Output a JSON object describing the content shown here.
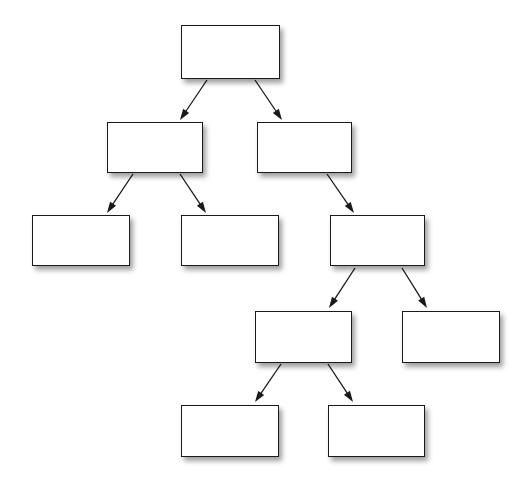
{
  "diagram": {
    "type": "tree-diagram",
    "title": "",
    "background_color": "#ffffff",
    "node_fill_color": "#ffffff",
    "node_border_color": "#1a1a1a",
    "edge_color": "#1a1a1a",
    "shadow_color": "rgba(0,0,0,0.38)",
    "node_count": 10,
    "edge_count": 9,
    "nodes": [
      {
        "id": "n1",
        "label": "",
        "level": 1,
        "x": 181,
        "y": 25,
        "w": 99,
        "h": 54
      },
      {
        "id": "n2",
        "label": "",
        "level": 2,
        "x": 107,
        "y": 122,
        "w": 96,
        "h": 51
      },
      {
        "id": "n3",
        "label": "",
        "level": 2,
        "x": 257,
        "y": 122,
        "w": 95,
        "h": 51
      },
      {
        "id": "n4",
        "label": "",
        "level": 3,
        "x": 32,
        "y": 215,
        "w": 98,
        "h": 51
      },
      {
        "id": "n5",
        "label": "",
        "level": 3,
        "x": 181,
        "y": 215,
        "w": 98,
        "h": 51
      },
      {
        "id": "n6",
        "label": "",
        "level": 3,
        "x": 330,
        "y": 215,
        "w": 95,
        "h": 51
      },
      {
        "id": "n7",
        "label": "",
        "level": 4,
        "x": 255,
        "y": 311,
        "w": 97,
        "h": 52
      },
      {
        "id": "n8",
        "label": "",
        "level": 4,
        "x": 402,
        "y": 311,
        "w": 98,
        "h": 52
      },
      {
        "id": "n9",
        "label": "",
        "level": 5,
        "x": 181,
        "y": 405,
        "w": 98,
        "h": 52
      },
      {
        "id": "n10",
        "label": "",
        "level": 5,
        "x": 328,
        "y": 405,
        "w": 97,
        "h": 52
      }
    ],
    "edges": [
      {
        "id": "e1",
        "from": "n1",
        "to": "n2",
        "x1": 207,
        "y1": 80,
        "x2": 180,
        "y2": 120,
        "arrow": true
      },
      {
        "id": "e2",
        "from": "n1",
        "to": "n3",
        "x1": 255,
        "y1": 80,
        "x2": 282,
        "y2": 120,
        "arrow": true
      },
      {
        "id": "e3",
        "from": "n2",
        "to": "n4",
        "x1": 133,
        "y1": 174,
        "x2": 107,
        "y2": 213,
        "arrow": true
      },
      {
        "id": "e4",
        "from": "n2",
        "to": "n5",
        "x1": 180,
        "y1": 174,
        "x2": 206,
        "y2": 213,
        "arrow": true
      },
      {
        "id": "e5",
        "from": "n3",
        "to": "n6",
        "x1": 327,
        "y1": 174,
        "x2": 354,
        "y2": 213,
        "arrow": true
      },
      {
        "id": "e6",
        "from": "n6",
        "to": "n7",
        "x1": 355,
        "y1": 268,
        "x2": 329,
        "y2": 308,
        "arrow": true
      },
      {
        "id": "e7",
        "from": "n6",
        "to": "n8",
        "x1": 402,
        "y1": 268,
        "x2": 427,
        "y2": 308,
        "arrow": true
      },
      {
        "id": "e8",
        "from": "n7",
        "to": "n9",
        "x1": 281,
        "y1": 364,
        "x2": 255,
        "y2": 402,
        "arrow": true
      },
      {
        "id": "e9",
        "from": "n7",
        "to": "n10",
        "x1": 328,
        "y1": 364,
        "x2": 353,
        "y2": 402,
        "arrow": true
      }
    ]
  }
}
